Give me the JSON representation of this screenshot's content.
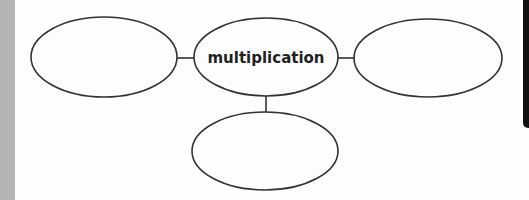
{
  "diagram": {
    "type": "concept-web",
    "center_node": {
      "label": "multiplication"
    },
    "nodes": [
      {
        "position": "left",
        "label": ""
      },
      {
        "position": "right",
        "label": ""
      },
      {
        "position": "bottom",
        "label": ""
      }
    ]
  },
  "colors": {
    "background": "#fdfdfd",
    "stroke": "#333333",
    "left_strip": "#b4b4b4",
    "right_tab": "#111111"
  }
}
